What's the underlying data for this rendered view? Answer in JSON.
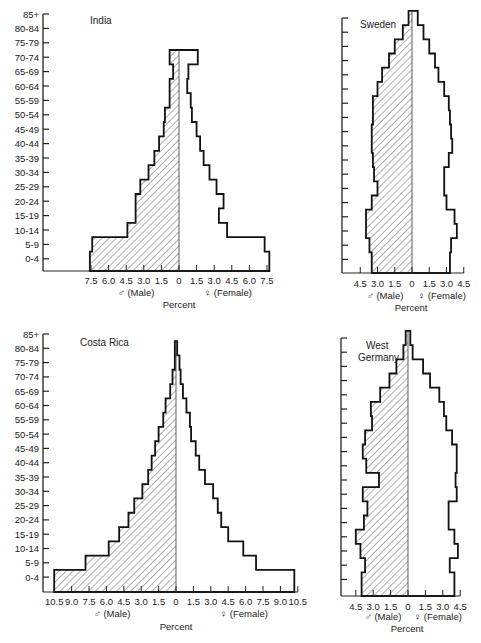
{
  "chart_data": [
    {
      "type": "bar",
      "subtype": "population-pyramid",
      "title": "India",
      "categories": [
        "0-4",
        "5-9",
        "10-14",
        "15-19",
        "20-24",
        "25-29",
        "30-34",
        "35-39",
        "40-44",
        "45-49",
        "50-54",
        "55-59",
        "60-64",
        "65-69",
        "70-74",
        "75-79",
        "80-84",
        "85+"
      ],
      "series": [
        {
          "name": "Male",
          "values": [
            7.6,
            7.4,
            4.4,
            3.7,
            3.7,
            3.3,
            2.6,
            2.1,
            1.7,
            1.3,
            1.2,
            0.8,
            0.8,
            0.5,
            0.8,
            0,
            0,
            0
          ]
        },
        {
          "name": "Female",
          "values": [
            7.7,
            7.3,
            4.1,
            3.4,
            3.8,
            3.2,
            2.6,
            2.1,
            1.8,
            1.5,
            1.1,
            1.0,
            0.7,
            0.8,
            1.6,
            0,
            0,
            0
          ]
        }
      ],
      "xlabel": "Percent",
      "male_label": "♂ (Male)",
      "female_label": "♀ (Female)",
      "xticks": [
        "7.5",
        "6.0",
        "4.5",
        "3.0",
        "1.5",
        "0",
        "1.5",
        "3.0",
        "4.5",
        "6.0",
        "7.5"
      ],
      "xlim": [
        -7.5,
        7.5
      ]
    },
    {
      "type": "bar",
      "subtype": "population-pyramid",
      "title": "Sweden",
      "categories": [
        "0-4",
        "5-9",
        "10-14",
        "15-19",
        "20-24",
        "25-29",
        "30-34",
        "35-39",
        "40-44",
        "45-49",
        "50-54",
        "55-59",
        "60-64",
        "65-69",
        "70-74",
        "75-79",
        "80-84",
        "85+"
      ],
      "series": [
        {
          "name": "Male",
          "values": [
            3.5,
            3.7,
            4.0,
            4.0,
            3.5,
            3.0,
            3.3,
            3.4,
            3.5,
            3.5,
            3.4,
            3.4,
            3.0,
            2.6,
            2.0,
            1.5,
            0.8,
            0.3
          ]
        },
        {
          "name": "Female",
          "values": [
            3.3,
            3.4,
            3.9,
            3.7,
            3.0,
            2.8,
            2.8,
            3.2,
            3.5,
            3.4,
            3.3,
            3.2,
            2.8,
            2.3,
            2.0,
            1.5,
            1.0,
            0.5
          ]
        }
      ],
      "xlabel": "Percent",
      "male_label": "♂ (Male)",
      "female_label": "♀ (Female)",
      "xticks": [
        "4.5",
        "3.0",
        "1.5",
        "0",
        "1.5",
        "3.0",
        "4.5"
      ],
      "xlim": [
        -4.5,
        4.5
      ]
    },
    {
      "type": "bar",
      "subtype": "population-pyramid",
      "title": "Costa Rica",
      "categories": [
        "0-4",
        "5-9",
        "10-14",
        "15-19",
        "20-24",
        "25-29",
        "30-34",
        "35-39",
        "40-44",
        "45-49",
        "50-54",
        "55-59",
        "60-64",
        "65-69",
        "70-74",
        "75-79",
        "80-84",
        "85+"
      ],
      "series": [
        {
          "name": "Male",
          "values": [
            10.5,
            7.8,
            5.8,
            4.9,
            4.1,
            3.6,
            2.9,
            2.4,
            2.1,
            1.8,
            1.5,
            1.1,
            0.9,
            0.5,
            0.3,
            0.1,
            0.1,
            0
          ]
        },
        {
          "name": "Female",
          "values": [
            10.2,
            6.9,
            5.8,
            4.5,
            3.9,
            3.6,
            3.2,
            2.5,
            2.0,
            1.7,
            1.3,
            1.2,
            0.9,
            0.6,
            0.4,
            0.3,
            0.1,
            0
          ]
        }
      ],
      "xlabel": "Percent",
      "male_label": "♂ (Male)",
      "female_label": "♀ (Female)",
      "xticks": [
        "10.5",
        "9.0",
        "7.5",
        "6.0",
        "4.5",
        "3.0",
        "1.5",
        "0",
        "1.5",
        "3.0",
        "4.5",
        "6.0",
        "7.5",
        "9.0",
        "10.5"
      ],
      "xlim": [
        -10.5,
        10.5
      ]
    },
    {
      "type": "bar",
      "subtype": "population-pyramid",
      "title": "West Germany",
      "categories": [
        "0-4",
        "5-9",
        "10-14",
        "15-19",
        "20-24",
        "25-29",
        "30-34",
        "35-39",
        "40-44",
        "45-49",
        "50-54",
        "55-59",
        "60-64",
        "65-69",
        "70-74",
        "75-79",
        "80-84",
        "85+"
      ],
      "series": [
        {
          "name": "Male",
          "values": [
            4.0,
            3.7,
            4.1,
            4.5,
            3.8,
            3.5,
            3.9,
            2.5,
            3.6,
            3.9,
            3.7,
            3.1,
            3.2,
            2.4,
            1.6,
            1.0,
            0.4,
            0.2
          ]
        },
        {
          "name": "Female",
          "values": [
            4.0,
            3.6,
            4.3,
            4.0,
            3.5,
            3.5,
            4.2,
            4.1,
            4.2,
            4.2,
            3.8,
            3.3,
            3.1,
            2.7,
            1.9,
            1.3,
            0.4,
            0.2
          ]
        }
      ],
      "xlabel": "Percent",
      "male_label": "♂ (Male)",
      "female_label": "♀ (Female)",
      "xticks": [
        "4.5",
        "3.0",
        "1.5",
        "0",
        "1.5",
        "3.0",
        "4.5"
      ],
      "xlim": [
        -4.5,
        4.5
      ]
    }
  ],
  "panels": {
    "india": {
      "title": "India"
    },
    "sweden": {
      "title": "Sweden"
    },
    "costa_rica": {
      "title": "Costa Rica"
    },
    "west_germany": {
      "title_line1": "West",
      "title_line2": "Germany"
    }
  },
  "age_labels": [
    "85+",
    "80-84",
    "75-79",
    "70-74",
    "65-69",
    "60-64",
    "55-59",
    "50-54",
    "45-49",
    "40-44",
    "35-39",
    "30-34",
    "25-29",
    "20-24",
    "15-19",
    "10-14",
    "5-9",
    "0-4"
  ],
  "axis": {
    "male_label": "♂ (Male)",
    "female_label": "♀ (Female)",
    "percent_label": "Percent"
  },
  "colors": {
    "line": "#111111",
    "hatch": "#333333",
    "background": "#ffffff"
  }
}
